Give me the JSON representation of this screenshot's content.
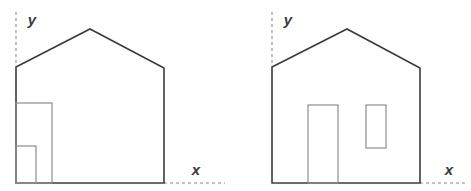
{
  "figure": {
    "background_color": "#ffffff",
    "width": 471,
    "height": 191
  },
  "style": {
    "outline_color": "#3b3b3b",
    "outline_width": 1.6,
    "detail_color": "#8c8c8c",
    "detail_width": 1.2,
    "axis_color": "#8a8a8a",
    "axis_width": 1.1,
    "axis_dash": "3 3",
    "label_color": "#3a3a3a"
  },
  "figures": [
    {
      "id": "house-left",
      "name": "house-diagram-left",
      "axes": {
        "y_label": "y",
        "x_label": "x",
        "y_label_x": 32,
        "y_label_y": 21,
        "x_label_x": 196,
        "x_label_y": 171,
        "y_axis_x": 16,
        "y_axis_top": 12,
        "y_axis_bottom": 67,
        "x_axis_y": 183,
        "x_axis_left": 164,
        "x_axis_right": 225
      },
      "outline": {
        "points": "16,183 16,67 90,29 164,68 164,183 16,183",
        "baseline_left_x": 16,
        "baseline_right_x": 164,
        "baseline_y": 183,
        "eave_left": [
          16,
          67
        ],
        "eave_right": [
          164,
          68
        ],
        "ridge": [
          90,
          29
        ]
      },
      "details": [
        {
          "name": "outer-opening-rect",
          "x": 16,
          "y": 103,
          "width": 36,
          "height": 80
        },
        {
          "name": "inner-opening-rect",
          "x": 16,
          "y": 146,
          "width": 20,
          "height": 37
        }
      ]
    },
    {
      "id": "house-right",
      "name": "house-diagram-right",
      "axes": {
        "y_label": "y",
        "x_label": "x",
        "y_label_x": 288,
        "y_label_y": 21,
        "x_label_x": 449,
        "x_label_y": 171,
        "y_axis_x": 272,
        "y_axis_top": 12,
        "y_axis_bottom": 67,
        "x_axis_y": 183,
        "x_axis_left": 420,
        "x_axis_right": 468
      },
      "outline": {
        "points": "272,183 272,67 347,29 420,68 420,183 272,183",
        "baseline_left_x": 272,
        "baseline_right_x": 420,
        "baseline_y": 183,
        "eave_left": [
          272,
          67
        ],
        "eave_right": [
          420,
          68
        ],
        "ridge": [
          347,
          29
        ]
      },
      "details": [
        {
          "name": "door-rect",
          "x": 308,
          "y": 105,
          "width": 30,
          "height": 78
        },
        {
          "name": "window-rect",
          "x": 366,
          "y": 105,
          "width": 20,
          "height": 43
        }
      ]
    }
  ]
}
